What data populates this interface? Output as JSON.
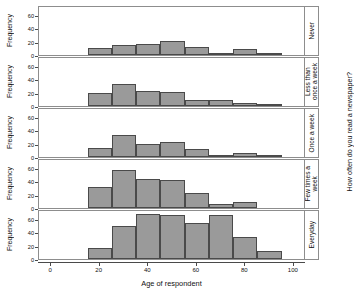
{
  "chart_data": {
    "type": "bar",
    "title": "",
    "subtitle": "",
    "xlabel": "Age of respondent",
    "ylabel": "Frequency",
    "facet_label": "How often do you read a newspaper?",
    "xlim": [
      -5,
      105
    ],
    "ylim": [
      0,
      75
    ],
    "xticks": [
      0,
      20,
      40,
      60,
      80,
      100
    ],
    "yticks": [
      0,
      20,
      40,
      60
    ],
    "grid": false,
    "legend": "none",
    "bin_width": 10,
    "bar_color": "#9a9a9a",
    "bar_border_color": "#4a4a4a",
    "panel_border_color": "#8d8d8d",
    "panels": [
      {
        "label": "Never",
        "label_lines": "Never",
        "bin_starts": [
          15,
          25,
          35,
          45,
          55,
          65,
          75,
          85
        ],
        "values": [
          11,
          16,
          17,
          22,
          12,
          3,
          10,
          1
        ]
      },
      {
        "label": "Less than once a week",
        "label_lines": "Less than\nonce a week",
        "bin_starts": [
          15,
          25,
          35,
          45,
          55,
          65,
          75,
          85
        ],
        "values": [
          20,
          35,
          24,
          22,
          9,
          9,
          5,
          2
        ]
      },
      {
        "label": "Once a week",
        "label_lines": "Once a week",
        "bin_starts": [
          15,
          25,
          35,
          45,
          55,
          65,
          75,
          85
        ],
        "values": [
          14,
          34,
          20,
          23,
          12,
          3,
          6,
          1
        ]
      },
      {
        "label": "Few times a week",
        "label_lines": "Few times a\nweek",
        "bin_starts": [
          15,
          25,
          35,
          45,
          55,
          65,
          75
        ],
        "values": [
          33,
          60,
          45,
          44,
          24,
          7,
          10
        ]
      },
      {
        "label": "Everyday",
        "label_lines": "Everyday",
        "bin_starts": [
          15,
          25,
          35,
          45,
          55,
          65,
          75,
          85
        ],
        "values": [
          17,
          52,
          70,
          68,
          56,
          69,
          34,
          12
        ]
      }
    ]
  }
}
